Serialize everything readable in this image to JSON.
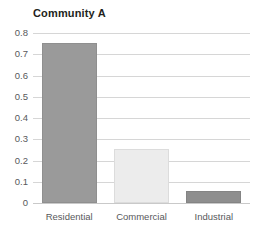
{
  "chart_data": {
    "type": "bar",
    "title": "Community A",
    "xlabel": "",
    "ylabel": "",
    "categories": [
      "Residential",
      "Commercial",
      "Industrial"
    ],
    "values": [
      0.755,
      0.255,
      0.055
    ],
    "series": [
      {
        "name": "Community A",
        "values": [
          0.755,
          0.255,
          0.055
        ]
      }
    ],
    "bar_colors": [
      "#9a9a9a",
      "#ececec",
      "#8e8e8e"
    ],
    "bar_border_colors": [
      "#8f8f8f",
      "#dcdcdc",
      "#848484"
    ],
    "ylim": [
      0,
      0.8
    ],
    "ytick_values": [
      0,
      0.1,
      0.2,
      0.3,
      0.4,
      0.5,
      0.6,
      0.7,
      0.8
    ],
    "ytick_labels": [
      "0",
      "0.1",
      "0.2",
      "0.3",
      "0.4",
      "0.5",
      "0.6",
      "0.7",
      "0.8"
    ],
    "grid": true,
    "grid_axis": "y",
    "grid_color": "#d6d6d6",
    "legend": false,
    "legend_position": "none",
    "background_color": "#ffffff",
    "title_color": "#231f20",
    "tick_label_color": "#58595b"
  },
  "axis": {
    "y": {
      "labels": [
        {
          "text": "0.8",
          "value": 0.8
        },
        {
          "text": "0.7",
          "value": 0.7
        },
        {
          "text": "0.6",
          "value": 0.6
        },
        {
          "text": "0.5",
          "value": 0.5
        },
        {
          "text": "0.4",
          "value": 0.4
        },
        {
          "text": "0.3",
          "value": 0.3
        },
        {
          "text": "0.2",
          "value": 0.2
        },
        {
          "text": "0.1",
          "value": 0.1
        },
        {
          "text": "0",
          "value": 0
        }
      ]
    },
    "x": {
      "labels": [
        {
          "text": "Residential"
        },
        {
          "text": "Commercial"
        },
        {
          "text": "Industrial"
        }
      ]
    }
  }
}
